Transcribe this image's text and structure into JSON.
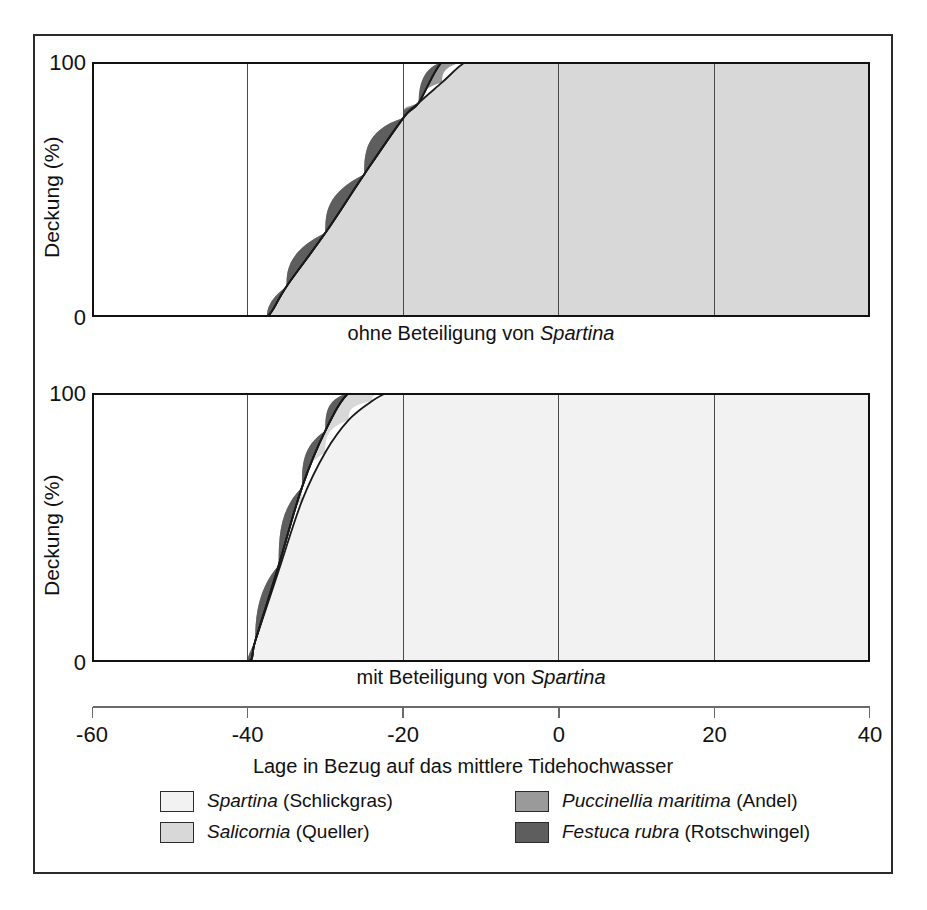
{
  "figure": {
    "y_axis_label": "Deckung (%)",
    "y_ticks": [
      "100",
      "0"
    ],
    "x_axis_label": "Lage in Bezug auf das mittlere Tidehochwasser",
    "x_ticks": [
      "-60",
      "-40",
      "-20",
      "0",
      "20",
      "40"
    ],
    "caption_top": "ohne Beteiligung von ",
    "caption_top_italic": "Spartina",
    "caption_bottom": "mit Beteiligung von ",
    "caption_bottom_italic": "Spartina"
  },
  "legend": {
    "items": [
      {
        "name": "Spartina",
        "common": " (Schlickgras)",
        "color": "#f2f2f2"
      },
      {
        "name": "Salicornia",
        "common": " (Queller)",
        "color": "#d8d8d8"
      },
      {
        "name": "Puccinellia maritima",
        "common": " (Andel)",
        "color": "#9a9a9a"
      },
      {
        "name": "Festuca rubra",
        "common": " (Rotschwingel)",
        "color": "#5e5e5e"
      }
    ]
  },
  "chart_data": [
    {
      "id": "ohne-spartina",
      "type": "area",
      "title": "ohne Beteiligung von Spartina",
      "xlabel": "Lage in Bezug auf das mittlere Tidehochwasser",
      "ylabel": "Deckung (%)",
      "xlim": [
        -60,
        40
      ],
      "ylim": [
        0,
        100
      ],
      "grid": true,
      "gridlines_x": [
        -40,
        -20,
        0,
        20
      ],
      "stacked": true,
      "legend_position": "below",
      "x": [
        -60,
        -50,
        -40,
        -37.5,
        -35,
        -30,
        -25,
        -20,
        -18,
        -15,
        -12,
        -10,
        -5,
        0,
        3,
        5,
        10,
        15,
        20,
        21,
        25,
        27,
        30,
        35,
        40
      ],
      "series": [
        {
          "name": "Spartina (Schlickgras)",
          "color": "#f2f2f2",
          "values": [
            0,
            0,
            0,
            0,
            0,
            0,
            0,
            0,
            0,
            0,
            0,
            0,
            0,
            0,
            0,
            0,
            0,
            0,
            0,
            0,
            0,
            0,
            0,
            0,
            0
          ]
        },
        {
          "name": "Salicornia (Queller)",
          "color": "#d8d8d8",
          "values": [
            0,
            0,
            0,
            0,
            12,
            33,
            56,
            78,
            84,
            92,
            100,
            100,
            100,
            100,
            100,
            100,
            100,
            100,
            100,
            100,
            100,
            100,
            100,
            100,
            100
          ]
        },
        {
          "name": "Puccinellia maritima (Andel)",
          "color": "#9a9a9a",
          "values": [
            0,
            0,
            0,
            0,
            0,
            0,
            0,
            0,
            0,
            10,
            22,
            30,
            58,
            88,
            100,
            100,
            100,
            100,
            100,
            100,
            100,
            100,
            100,
            100,
            100
          ]
        },
        {
          "name": "Festuca rubra (Rotschwingel)",
          "color": "#5e5e5e",
          "values": [
            0,
            0,
            0,
            0,
            0,
            0,
            0,
            0,
            0,
            0,
            0,
            0,
            0,
            0,
            0,
            0,
            0,
            0,
            0,
            0,
            38,
            62,
            100,
            100,
            100
          ]
        }
      ]
    },
    {
      "id": "mit-spartina",
      "type": "area",
      "title": "mit Beteiligung von Spartina",
      "xlabel": "Lage in Bezug auf das mittlere Tidehochwasser",
      "ylabel": "Deckung (%)",
      "xlim": [
        -60,
        40
      ],
      "ylim": [
        0,
        100
      ],
      "grid": true,
      "gridlines_x": [
        -40,
        -20,
        0,
        20
      ],
      "stacked": true,
      "legend_position": "below",
      "x": [
        -60,
        -50,
        -40,
        -39,
        -36,
        -33,
        -30,
        -27,
        -24,
        -22,
        -20,
        -15,
        -12,
        -10.5,
        -8,
        -5,
        0,
        5,
        10,
        15,
        20,
        22,
        24,
        26,
        28,
        30,
        35,
        40
      ],
      "series": [
        {
          "name": "Spartina (Schlickgras)",
          "color": "#f2f2f2",
          "values": [
            0,
            0,
            0,
            8,
            34,
            60,
            78,
            90,
            97,
            100,
            100,
            100,
            100,
            100,
            100,
            100,
            100,
            100,
            100,
            100,
            100,
            100,
            100,
            100,
            100,
            100,
            100,
            100
          ]
        },
        {
          "name": "Salicornia (Queller)",
          "color": "#d8d8d8",
          "values": [
            0,
            0,
            0,
            0,
            2,
            5,
            8,
            11,
            14,
            16,
            18,
            22,
            24,
            25,
            25,
            26,
            26,
            28,
            31,
            35,
            41,
            45,
            52,
            64,
            80,
            92,
            100,
            100
          ]
        },
        {
          "name": "Puccinellia maritima (Andel)",
          "color": "#9a9a9a",
          "values": [
            0,
            0,
            0,
            0,
            0,
            0,
            0,
            0,
            0,
            0,
            0,
            0,
            0,
            0,
            8,
            13,
            19,
            23,
            27,
            32,
            39,
            44,
            52,
            64,
            80,
            92,
            100,
            100
          ]
        },
        {
          "name": "Festuca rubra (Rotschwingel)",
          "color": "#5e5e5e",
          "values": [
            0,
            0,
            0,
            0,
            0,
            0,
            0,
            0,
            0,
            0,
            0,
            0,
            0,
            0,
            0,
            0,
            0,
            0,
            0,
            0,
            0,
            0,
            5,
            30,
            70,
            92,
            100,
            100
          ]
        }
      ]
    }
  ]
}
